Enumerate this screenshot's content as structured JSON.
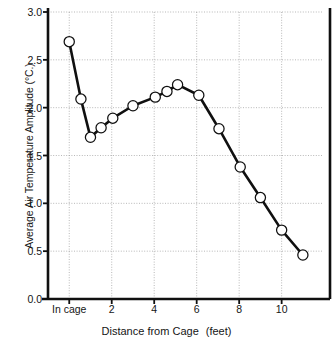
{
  "chart_data": {
    "type": "line",
    "title": "",
    "xlabel_main": "Distance from Cage",
    "xlabel_unit": "(feet)",
    "ylabel": "Average Air Temperature Amplitude (°C.)",
    "xlim": [
      -1.0,
      11.9
    ],
    "ylim": [
      0.0,
      3.0
    ],
    "grid": true,
    "legend": "none",
    "marker": "open-circle",
    "line_color": "#101010",
    "marker_face_color": "#ffffff",
    "marker_edge_color": "#101010",
    "x": [
      0.0,
      0.55,
      1.0,
      1.5,
      2.05,
      3.0,
      4.05,
      4.6,
      5.1,
      6.1,
      7.05,
      8.05,
      9.0,
      10.0,
      11.0
    ],
    "y": [
      2.69,
      2.09,
      1.69,
      1.79,
      1.89,
      2.02,
      2.11,
      2.17,
      2.24,
      2.13,
      1.78,
      1.38,
      1.06,
      0.72,
      0.46
    ],
    "ytick_values": [
      0.0,
      0.5,
      1.0,
      1.5,
      2.0,
      2.5,
      3.0
    ],
    "ytick_labels": [
      "0.0",
      "0.5",
      "1.0",
      "1.5",
      "2.0",
      "2.5",
      "3.0"
    ],
    "xtick_values": [
      0,
      2,
      4,
      6,
      8,
      10
    ],
    "xtick_labels": [
      "In cage",
      "2",
      "4",
      "6",
      "8",
      "10"
    ]
  }
}
